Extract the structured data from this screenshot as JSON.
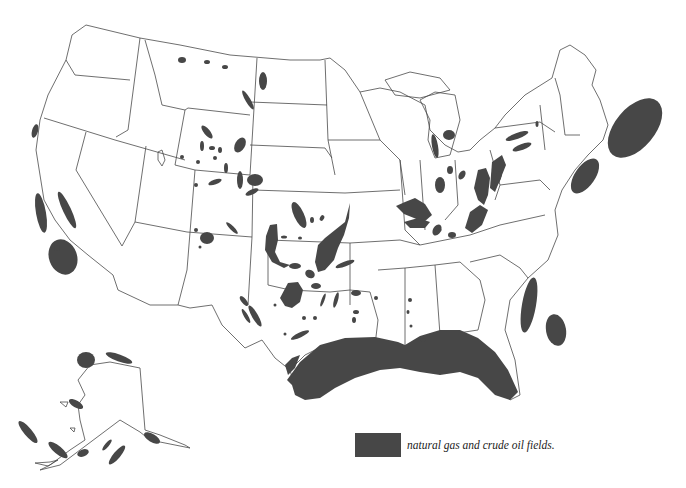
{
  "map": {
    "subject": "Natural gas and crude oil fields of the United States",
    "regions_shown": [
      "Contiguous United States",
      "Alaska"
    ],
    "colors": {
      "field_fill": "#474747",
      "outline": "#4a4a4a",
      "background": "#ffffff"
    }
  },
  "legend": {
    "items": [
      {
        "swatch_color": "#474747",
        "label": "natural gas and crude oil fields."
      }
    ]
  }
}
